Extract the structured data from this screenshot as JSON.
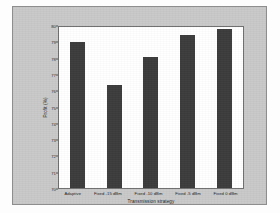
{
  "figure": {
    "panel_background": "#c9c9c9",
    "plot_background": "#ffffff",
    "bar_color": "#3c3c3c"
  },
  "chart_data": {
    "type": "bar",
    "title": "",
    "xlabel": "Transmission strategy",
    "ylabel": "Profit (%)",
    "categories": [
      "Adaptive",
      "Fixed -15 dBm",
      "Fixed -10 dBm",
      "Fixed -5 dBm",
      "Fixed 0 dBm"
    ],
    "values": [
      79.1,
      76.4,
      78.15,
      79.5,
      79.9
    ],
    "ylim": [
      70,
      80
    ],
    "ytick_labels": [
      "80",
      "79",
      "78",
      "77",
      "76",
      "75",
      "74",
      "73",
      "72",
      "71",
      "70"
    ],
    "ytick_values": [
      80,
      79,
      78,
      77,
      76,
      75,
      74,
      73,
      72,
      71,
      70
    ],
    "grid": false,
    "legend": null
  }
}
